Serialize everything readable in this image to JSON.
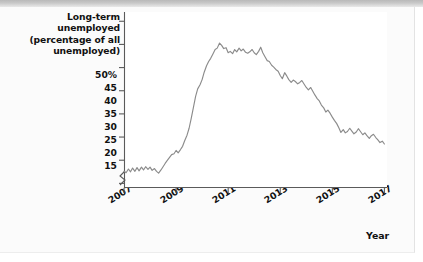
{
  "figure": {
    "background_color": "#fafafa",
    "plot_background_color": "#ffffff",
    "line_color": "#8b8b8b",
    "axis_color": "#5a5a5a",
    "text_color": "#111111",
    "top_strip_color": "#c4c4c4"
  },
  "chart_data": {
    "type": "line",
    "title": "",
    "ylabel": "Long-term unemployed (percentage of all unemployed)",
    "ylabel_lines": [
      "Long-term unemployed",
      "(percentage of all",
      "unemployed)"
    ],
    "xlabel": "Year",
    "ylim": [
      14,
      52
    ],
    "xlim": [
      2007.0,
      2017.1
    ],
    "grid": false,
    "legend": null,
    "y_ticks": [
      15,
      20,
      25,
      30,
      35,
      40,
      45,
      50
    ],
    "y_tick_labels": [
      "15",
      "20",
      "25",
      "30",
      "35",
      "40",
      "45",
      "50%"
    ],
    "x_ticks": [
      2007,
      2009,
      2011,
      2013,
      2015,
      2017
    ],
    "x_tick_labels": [
      "2007",
      "2009",
      "2011",
      "2013",
      "2015",
      "2017"
    ],
    "axis_break": true,
    "series": [
      {
        "name": "Long-term unemployed share",
        "x": [
          2007.0,
          2007.08,
          2007.17,
          2007.25,
          2007.33,
          2007.42,
          2007.5,
          2007.58,
          2007.67,
          2007.75,
          2007.83,
          2007.92,
          2008.0,
          2008.08,
          2008.17,
          2008.25,
          2008.33,
          2008.42,
          2008.5,
          2008.58,
          2008.67,
          2008.75,
          2008.83,
          2008.92,
          2009.0,
          2009.08,
          2009.17,
          2009.25,
          2009.33,
          2009.42,
          2009.5,
          2009.58,
          2009.67,
          2009.75,
          2009.83,
          2009.92,
          2010.0,
          2010.08,
          2010.17,
          2010.25,
          2010.33,
          2010.42,
          2010.5,
          2010.58,
          2010.67,
          2010.75,
          2010.83,
          2010.92,
          2011.0,
          2011.08,
          2011.17,
          2011.25,
          2011.33,
          2011.42,
          2011.5,
          2011.58,
          2011.67,
          2011.75,
          2011.83,
          2011.92,
          2012.0,
          2012.08,
          2012.17,
          2012.25,
          2012.33,
          2012.42,
          2012.5,
          2012.58,
          2012.67,
          2012.75,
          2012.83,
          2012.92,
          2013.0,
          2013.08,
          2013.17,
          2013.25,
          2013.33,
          2013.42,
          2013.5,
          2013.58,
          2013.67,
          2013.75,
          2013.83,
          2013.92,
          2014.0,
          2014.08,
          2014.17,
          2014.25,
          2014.33,
          2014.42,
          2014.5,
          2014.58,
          2014.67,
          2014.75,
          2014.83,
          2014.92,
          2015.0,
          2015.08,
          2015.17,
          2015.25,
          2015.33,
          2015.42,
          2015.5,
          2015.58,
          2015.67,
          2015.75,
          2015.83,
          2015.92,
          2016.0,
          2016.08,
          2016.17,
          2016.25,
          2016.33,
          2016.42,
          2016.5,
          2016.58,
          2016.67,
          2016.75,
          2016.83,
          2016.92,
          2017.0
        ],
        "values": [
          17.6,
          17.3,
          18.1,
          17.5,
          18.3,
          17.6,
          18.4,
          17.7,
          18.5,
          17.9,
          18.6,
          18.0,
          18.5,
          17.8,
          18.2,
          17.6,
          17.2,
          17.9,
          18.6,
          19.3,
          20.0,
          20.6,
          21.2,
          21.4,
          22.1,
          21.6,
          22.3,
          23.0,
          24.2,
          25.4,
          26.9,
          29.0,
          31.5,
          33.8,
          35.4,
          36.3,
          37.4,
          39.0,
          40.4,
          41.3,
          42.0,
          43.0,
          43.9,
          44.2,
          45.3,
          44.8,
          44.1,
          44.3,
          43.2,
          43.5,
          43.0,
          43.9,
          43.4,
          44.2,
          43.6,
          44.0,
          43.3,
          43.1,
          43.4,
          43.9,
          43.2,
          42.8,
          43.5,
          44.4,
          43.2,
          42.3,
          41.5,
          41.3,
          40.5,
          40.1,
          39.6,
          39.2,
          38.3,
          37.6,
          38.9,
          38.2,
          37.4,
          36.8,
          37.3,
          37.0,
          36.5,
          36.8,
          37.2,
          36.4,
          35.7,
          35.2,
          35.7,
          34.9,
          34.1,
          33.3,
          32.8,
          31.9,
          31.3,
          30.4,
          30.8,
          30.1,
          29.3,
          28.6,
          27.9,
          27.0,
          26.0,
          26.6,
          25.9,
          26.2,
          26.9,
          26.3,
          25.7,
          26.1,
          26.8,
          26.2,
          25.5,
          25.9,
          25.3,
          24.7,
          25.3,
          25.6,
          24.9,
          24.4,
          23.8,
          24.1,
          23.5
        ]
      }
    ]
  }
}
